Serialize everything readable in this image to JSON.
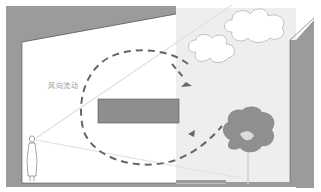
{
  "diagram": {
    "type": "architectural-section",
    "labels": {
      "airflow": "风向流动"
    },
    "elements": [
      {
        "name": "building-wall",
        "kind": "section-wall"
      },
      {
        "name": "roof",
        "kind": "sloped-roof"
      },
      {
        "name": "courtyard",
        "kind": "open-courtyard"
      },
      {
        "name": "ceiling-block",
        "kind": "rectangle"
      },
      {
        "name": "person",
        "kind": "human-figure"
      },
      {
        "name": "tree",
        "kind": "tree"
      },
      {
        "name": "cloud-large",
        "kind": "cloud"
      },
      {
        "name": "cloud-small",
        "kind": "cloud"
      },
      {
        "name": "airflow-loop",
        "kind": "dashed-arrow-loop"
      },
      {
        "name": "sightlines",
        "kind": "view-lines"
      }
    ],
    "colors": {
      "wall": "#9b9b9b",
      "wall_edge": "#555555",
      "courtyard": "#eeeeee",
      "interior": "#ffffff",
      "arrow": "#666666",
      "sightline": "#e3e3e3",
      "tree": "#8f8f8f",
      "label": "#9a9a9a"
    }
  }
}
